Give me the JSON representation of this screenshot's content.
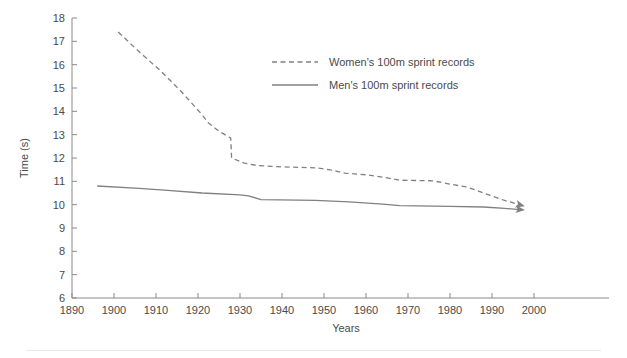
{
  "chart_data": {
    "type": "line",
    "title": "",
    "subtitle": "",
    "xlabel": "Years",
    "ylabel": "Time (s)",
    "xlim": [
      1890,
      2002
    ],
    "ylim": [
      6,
      18
    ],
    "xticks": [
      1890,
      1900,
      1910,
      1920,
      1930,
      1940,
      1950,
      1960,
      1970,
      1980,
      1990,
      2000
    ],
    "xtick_labels": [
      "1890",
      "1900",
      "1910",
      "1920",
      "1930",
      "1940",
      "1950",
      "1960",
      "1970",
      "1980",
      "1990",
      "2000"
    ],
    "yticks": [
      6,
      7,
      8,
      9,
      10,
      11,
      12,
      13,
      14,
      15,
      16,
      17,
      18
    ],
    "ytick_labels": [
      "6",
      "7",
      "8",
      "9",
      "10",
      "11",
      "12",
      "13",
      "14",
      "15",
      "16",
      "17",
      "18"
    ],
    "grid": false,
    "legend_position": "upper-right",
    "line_color": "#808080",
    "axis_color": "#8a8a8a",
    "series": [
      {
        "name": "Women's 100m sprint records",
        "style": "dashed",
        "arrow_end": true,
        "points": [
          [
            1901,
            17.4
          ],
          [
            1906,
            16.55
          ],
          [
            1911,
            15.75
          ],
          [
            1916,
            14.85
          ],
          [
            1921,
            13.85
          ],
          [
            1922.5,
            13.5
          ],
          [
            1925,
            13.15
          ],
          [
            1927.8,
            12.85
          ],
          [
            1928,
            12.0
          ],
          [
            1931,
            11.78
          ],
          [
            1934,
            11.68
          ],
          [
            1940,
            11.62
          ],
          [
            1948,
            11.58
          ],
          [
            1952,
            11.48
          ],
          [
            1955,
            11.35
          ],
          [
            1960,
            11.28
          ],
          [
            1965,
            11.15
          ],
          [
            1968,
            11.05
          ],
          [
            1976,
            11.02
          ],
          [
            1980,
            10.88
          ],
          [
            1984,
            10.76
          ],
          [
            1988,
            10.5
          ],
          [
            1993,
            10.18
          ],
          [
            1997.5,
            9.95
          ]
        ]
      },
      {
        "name": "Men's 100m sprint records",
        "style": "solid",
        "arrow_end": true,
        "points": [
          [
            1896,
            10.8
          ],
          [
            1906,
            10.7
          ],
          [
            1912,
            10.62
          ],
          [
            1921,
            10.5
          ],
          [
            1930,
            10.42
          ],
          [
            1932,
            10.38
          ],
          [
            1935,
            10.22
          ],
          [
            1948,
            10.18
          ],
          [
            1956,
            10.12
          ],
          [
            1964,
            10.02
          ],
          [
            1968,
            9.96
          ],
          [
            1980,
            9.93
          ],
          [
            1988,
            9.9
          ],
          [
            1993,
            9.84
          ],
          [
            1997.5,
            9.78
          ]
        ]
      }
    ],
    "legend": [
      {
        "label": "Women's 100m sprint records",
        "style": "dashed"
      },
      {
        "label": "Men's 100m sprint records",
        "style": "solid"
      }
    ]
  }
}
